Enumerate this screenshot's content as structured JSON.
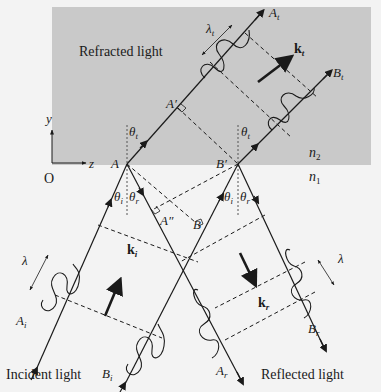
{
  "figure": {
    "media_labels": {
      "upper_medium": {
        "symbol": "n",
        "subscript": "2"
      },
      "lower_medium": {
        "symbol": "n",
        "subscript": "1"
      }
    },
    "captions": {
      "refracted": "Refracted light",
      "incident": "Incident light",
      "reflected": "Reflected light"
    },
    "axes": {
      "origin": "O",
      "y_label": "y",
      "z_label": "z"
    },
    "points": {
      "A": "A",
      "A_prime": "A′",
      "A_double_prime": "A″",
      "B": "B",
      "B_prime": "B′"
    },
    "rays": {
      "incident_A": {
        "symbol": "A",
        "subscript": "i"
      },
      "incident_B": {
        "symbol": "B",
        "subscript": "i"
      },
      "reflected_A": {
        "symbol": "A",
        "subscript": "r"
      },
      "reflected_B": {
        "symbol": "B",
        "subscript": "r"
      },
      "transmitted_A": {
        "symbol": "A",
        "subscript": "t"
      },
      "transmitted_B": {
        "symbol": "B",
        "subscript": "t"
      }
    },
    "wave_vectors": {
      "incident": {
        "symbol": "k",
        "subscript": "i"
      },
      "reflected": {
        "symbol": "k",
        "subscript": "r"
      },
      "transmitted": {
        "symbol": "k",
        "subscript": "t"
      }
    },
    "angles": {
      "incident": {
        "symbol": "θ",
        "subscript": "i"
      },
      "reflected": {
        "symbol": "θ",
        "subscript": "r"
      },
      "transmitted": {
        "symbol": "θ",
        "subscript": "t"
      }
    },
    "wavelengths": {
      "incident": "λ",
      "reflected": "λ",
      "transmitted": {
        "symbol": "λ",
        "subscript": "t"
      }
    },
    "colors": {
      "upper_medium_fill": "#c9c9c9",
      "background": "#f3f3f3",
      "ink": "#1a1a1a"
    }
  }
}
